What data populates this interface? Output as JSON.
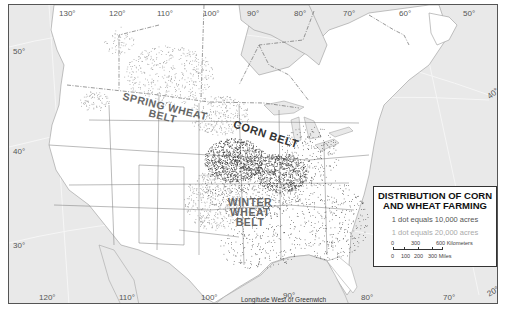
{
  "map": {
    "title_line1": "DISTRIBUTION OF CORN",
    "title_line2": "AND WHEAT FARMING",
    "legend": {
      "corn_dot": "1 dot equals 10,000 acres",
      "wheat_dot": "1 dot equals 20,000 acres",
      "scale_km": [
        "0",
        "300",
        "600 Kilometers"
      ],
      "scale_mi": [
        "0",
        "100",
        "200",
        "300 Miles"
      ]
    },
    "regions": {
      "spring_wheat": [
        "SPRING WHEAT",
        "BELT"
      ],
      "corn": "CORN BELT",
      "winter_wheat": [
        "WINTER",
        "WHEAT",
        "BELT"
      ]
    },
    "longitude_top": [
      "130°",
      "120°",
      "110°",
      "100°",
      "90°",
      "80°",
      "70°",
      "60°",
      "50°"
    ],
    "longitude_bottom": [
      "120°",
      "110°",
      "100°",
      "90°",
      "80°",
      "70°"
    ],
    "latitude_left": [
      "50°",
      "40°",
      "30°"
    ],
    "latitude_right": [
      "40°",
      "20°"
    ],
    "footer": "Longitude West of Greenwich",
    "colors": {
      "water": "#e9e9e9",
      "land": "#ffffff",
      "corn_dot": "#222222",
      "wheat_dot": "#888888",
      "legend_border": "#333333"
    }
  }
}
